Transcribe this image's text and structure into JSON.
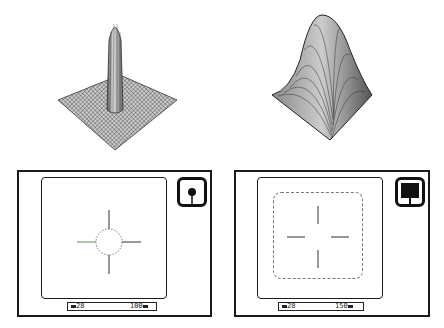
{
  "plots": [
    {
      "name": "narrow-peak-surface",
      "description": "3D wireframe surface with narrow tall peak"
    },
    {
      "name": "wide-peak-surface",
      "description": "3D wireframe surface with broad peak"
    }
  ],
  "panels": [
    {
      "name": "spot-metering-view",
      "indicator": "spot-icon",
      "target": "circle",
      "status": {
        "left": "28",
        "right": "100"
      }
    },
    {
      "name": "area-metering-view",
      "indicator": "area-icon",
      "target": "rounded-rect",
      "status": {
        "left": "28",
        "right": "150"
      }
    }
  ],
  "colors": {
    "line": "#1a1a1a",
    "mesh": "#555555",
    "dashed": "#777777"
  }
}
